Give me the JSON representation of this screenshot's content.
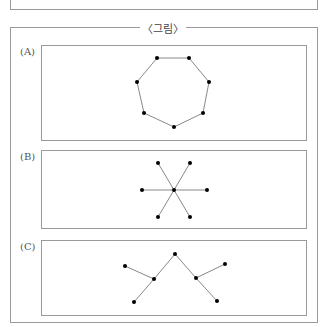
{
  "figure": {
    "title": "〈그림〉",
    "panels": [
      {
        "label": "(A)",
        "shape": "heptagon cycle graph",
        "vertices": 7,
        "edges": 7
      },
      {
        "label": "(B)",
        "shape": "star graph",
        "vertices": 7,
        "edges": 6
      },
      {
        "label": "(C)",
        "shape": "tree graph",
        "vertices": 7,
        "edges": 6
      }
    ]
  },
  "colors": {
    "border": "#9a9a9a",
    "edge": "#888888",
    "vertex": "#000000"
  }
}
